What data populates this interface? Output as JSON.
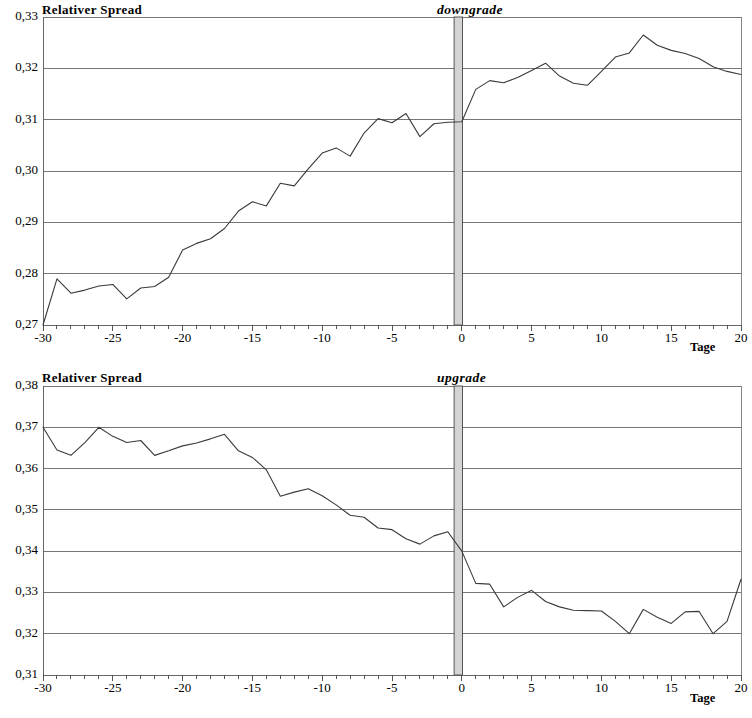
{
  "figure": {
    "background": "#ffffff",
    "line_color": "#3a3a3a",
    "grid_color": "#666666",
    "event_band_fill": "#d4d4d4",
    "event_band_stroke": "#555555"
  },
  "panels": [
    {
      "id": "downgrade",
      "y_axis_title": "Relativer Spread",
      "event_label": "downgrade",
      "x_axis_title": "Tage"
    },
    {
      "id": "upgrade",
      "y_axis_title": "Relativer Spread",
      "event_label": "upgrade",
      "x_axis_title": "Tage"
    }
  ],
  "chart_data": [
    {
      "type": "line",
      "title": "downgrade",
      "subtitle": "",
      "ylabel": "Relativer Spread",
      "xlabel": "Tage",
      "xlim": [
        -30,
        20
      ],
      "ylim": [
        0.27,
        0.33
      ],
      "yticks": [
        0.27,
        0.28,
        0.29,
        0.3,
        0.31,
        0.32,
        0.33
      ],
      "ytick_labels": [
        "0,27",
        "0,28",
        "0,29",
        "0,30",
        "0,31",
        "0,32",
        "0,33"
      ],
      "xticks": [
        -30,
        -25,
        -20,
        -15,
        -10,
        -5,
        0,
        5,
        10,
        15,
        20
      ],
      "xtick_labels": [
        "-30",
        "-25",
        "-20",
        "-15",
        "-10",
        "-5",
        "0",
        "5",
        "10",
        "15",
        "20"
      ],
      "minor_xtick_step": 1,
      "grid": "horizontal",
      "legend": "none",
      "annotations": [
        {
          "type": "vertical-band",
          "label": "downgrade",
          "x_from": -0.55,
          "x_to": 0.05
        }
      ],
      "x": [
        -30,
        -29,
        -28,
        -27,
        -26,
        -25,
        -24,
        -23,
        -22,
        -21,
        -20,
        -19,
        -18,
        -17,
        -16,
        -15,
        -14,
        -13,
        -12,
        -11,
        -10,
        -9,
        -8,
        -7,
        -6,
        -5,
        -4,
        -3,
        -2,
        -1,
        0,
        1,
        2,
        3,
        4,
        5,
        6,
        7,
        8,
        9,
        10,
        11,
        12,
        13,
        14,
        15,
        16,
        17,
        18,
        19,
        20
      ],
      "values": [
        0.27,
        0.279,
        0.2762,
        0.2768,
        0.2776,
        0.2779,
        0.2751,
        0.2772,
        0.2775,
        0.2793,
        0.2846,
        0.2859,
        0.2868,
        0.2888,
        0.2922,
        0.294,
        0.2932,
        0.2976,
        0.2971,
        0.3004,
        0.3035,
        0.3045,
        0.3029,
        0.3074,
        0.3102,
        0.3094,
        0.3112,
        0.3067,
        0.3092,
        0.3095,
        0.3096,
        0.3159,
        0.3176,
        0.3172,
        0.3182,
        0.3196,
        0.321,
        0.3185,
        0.3171,
        0.3167,
        0.3194,
        0.3222,
        0.323,
        0.3265,
        0.3245,
        0.3235,
        0.3229,
        0.3219,
        0.3203,
        0.3194,
        0.3188
      ]
    },
    {
      "type": "line",
      "title": "upgrade",
      "subtitle": "",
      "ylabel": "Relativer Spread",
      "xlabel": "Tage",
      "xlim": [
        -30,
        20
      ],
      "ylim": [
        0.31,
        0.38
      ],
      "yticks": [
        0.31,
        0.32,
        0.33,
        0.34,
        0.35,
        0.36,
        0.37,
        0.38
      ],
      "ytick_labels": [
        "0,31",
        "0,32",
        "0,33",
        "0,34",
        "0,35",
        "0,36",
        "0,37",
        "0,38"
      ],
      "xticks": [
        -30,
        -25,
        -20,
        -15,
        -10,
        -5,
        0,
        5,
        10,
        15,
        20
      ],
      "xtick_labels": [
        "-30",
        "-25",
        "-20",
        "-15",
        "-10",
        "-5",
        "0",
        "5",
        "10",
        "15",
        "20"
      ],
      "minor_xtick_step": 1,
      "grid": "horizontal",
      "legend": "none",
      "annotations": [
        {
          "type": "vertical-band",
          "label": "upgrade",
          "x_from": -0.55,
          "x_to": 0.05
        }
      ],
      "x": [
        -30,
        -29,
        -28,
        -27,
        -26,
        -25,
        -24,
        -23,
        -22,
        -21,
        -20,
        -19,
        -18,
        -17,
        -16,
        -15,
        -14,
        -13,
        -12,
        -11,
        -10,
        -9,
        -8,
        -7,
        -6,
        -5,
        -4,
        -3,
        -2,
        -1,
        0,
        1,
        2,
        3,
        4,
        5,
        6,
        7,
        8,
        9,
        10,
        11,
        12,
        13,
        14,
        15,
        16,
        17,
        18,
        19,
        20
      ],
      "values": [
        0.37,
        0.3645,
        0.3632,
        0.3663,
        0.37,
        0.3678,
        0.3663,
        0.3668,
        0.3632,
        0.3643,
        0.3655,
        0.3662,
        0.3672,
        0.3683,
        0.3643,
        0.3627,
        0.3597,
        0.3533,
        0.3543,
        0.3551,
        0.3534,
        0.3512,
        0.3487,
        0.3482,
        0.3456,
        0.3452,
        0.343,
        0.3417,
        0.3437,
        0.3447,
        0.34,
        0.3322,
        0.332,
        0.3265,
        0.3288,
        0.3305,
        0.3278,
        0.3265,
        0.3257,
        0.3256,
        0.3255,
        0.323,
        0.32,
        0.3259,
        0.324,
        0.3225,
        0.3253,
        0.3254,
        0.32,
        0.323,
        0.3332
      ]
    }
  ]
}
